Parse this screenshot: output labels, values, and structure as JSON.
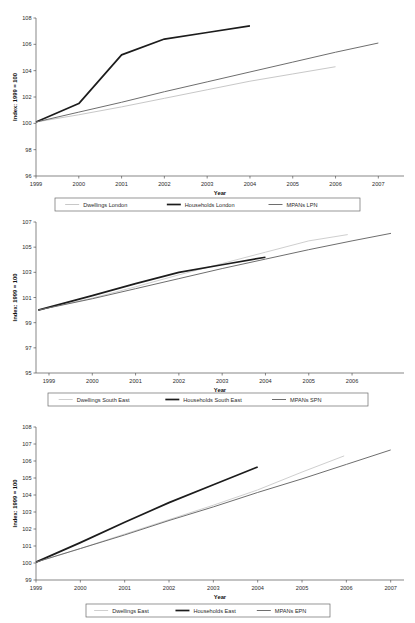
{
  "page": {
    "background": "#ffffff",
    "text_color": "#1a1a1a"
  },
  "chart_data": [
    {
      "id": "london",
      "type": "line",
      "title": "",
      "xlabel": "Year",
      "ylabel": "Index: 1999 = 100",
      "x": [
        1999,
        2000,
        2001,
        2002,
        2003,
        2004,
        2005,
        2006,
        2007
      ],
      "xticks": [
        "1999",
        "2000",
        "2001",
        "2002",
        "2003",
        "2004",
        "2005",
        "2006",
        "2007"
      ],
      "xlim": [
        1999,
        2007.6
      ],
      "ylim": [
        96,
        108
      ],
      "yticks": [
        96,
        98,
        100,
        102,
        104,
        106,
        108
      ],
      "ytick_labels": [
        "96",
        "98",
        "100",
        "102",
        "104",
        "106",
        "108"
      ],
      "grid": false,
      "legend_position": "bottom",
      "series": [
        {
          "name": "Dwellings London",
          "color": "#c8c8c8",
          "width": 1.0,
          "x": [
            1999,
            2000,
            2001,
            2002,
            2003,
            2004,
            2005,
            2006
          ],
          "values": [
            100.1,
            100.65,
            101.25,
            101.9,
            102.55,
            103.2,
            103.75,
            104.3
          ]
        },
        {
          "name": "Households London",
          "color": "#1c1c1c",
          "width": 1.7,
          "x": [
            1999,
            2000,
            2001,
            2002,
            2003,
            2004
          ],
          "values": [
            100.1,
            101.5,
            105.2,
            106.4,
            106.9,
            107.4
          ]
        },
        {
          "name": "MPANs LPN",
          "color": "#6e6e6e",
          "width": 1.0,
          "x": [
            1999,
            2000,
            2001,
            2002,
            2003,
            2004,
            2005,
            2006,
            2007
          ],
          "values": [
            100.1,
            100.85,
            101.6,
            102.4,
            103.15,
            103.9,
            104.65,
            105.4,
            106.1
          ]
        }
      ]
    },
    {
      "id": "south-east",
      "type": "line",
      "title": "",
      "xlabel": "Year",
      "ylabel": "Index: 1999 = 100",
      "x": [
        1999,
        2000,
        2001,
        2002,
        2003,
        2004,
        2005,
        2006
      ],
      "xticks": [
        "1999",
        "2000",
        "2001",
        "2002",
        "2003",
        "2004",
        "2005",
        "2006"
      ],
      "xlim": [
        1998.7,
        2007.2
      ],
      "ylim": [
        95,
        107
      ],
      "yticks": [
        95,
        97,
        99,
        101,
        103,
        105,
        107
      ],
      "ytick_labels": [
        "95",
        "97",
        "99",
        "101",
        "103",
        "105",
        "107"
      ],
      "grid": false,
      "legend_position": "bottom",
      "series": [
        {
          "name": "Dwellings South East",
          "color": "#cfcfcf",
          "width": 1.0,
          "x": [
            1998.75,
            2000,
            2001,
            2002,
            2003,
            2004,
            2005,
            2005.9
          ],
          "values": [
            100.0,
            100.95,
            101.85,
            102.8,
            103.7,
            104.6,
            105.5,
            106.0
          ]
        },
        {
          "name": "Households South East",
          "color": "#1c1c1c",
          "width": 1.7,
          "x": [
            1998.75,
            2000,
            2001,
            2002,
            2003,
            2004
          ],
          "values": [
            100.0,
            101.15,
            102.1,
            103.0,
            103.6,
            104.2
          ]
        },
        {
          "name": "MPANs SPN",
          "color": "#6e6e6e",
          "width": 1.0,
          "x": [
            1998.75,
            2000,
            2001,
            2002,
            2003,
            2004,
            2005,
            2006,
            2006.9
          ],
          "values": [
            100.0,
            100.9,
            101.7,
            102.5,
            103.3,
            104.05,
            104.8,
            105.5,
            106.1
          ]
        }
      ]
    },
    {
      "id": "east",
      "type": "line",
      "title": "",
      "xlabel": "Year",
      "ylabel": "Index: 1999 = 100",
      "x": [
        1999,
        2000,
        2001,
        2002,
        2003,
        2004,
        2005,
        2006,
        2007
      ],
      "xticks": [
        "1999",
        "2000",
        "2001",
        "2002",
        "2003",
        "2004",
        "2005",
        "2006",
        "2007"
      ],
      "xlim": [
        1999,
        2007.3
      ],
      "ylim": [
        99,
        108
      ],
      "yticks": [
        99,
        100,
        101,
        102,
        103,
        104,
        105,
        106,
        107,
        108
      ],
      "ytick_labels": [
        "99",
        "100",
        "101",
        "102",
        "103",
        "104",
        "105",
        "106",
        "107",
        "108"
      ],
      "grid": false,
      "legend_position": "bottom",
      "series": [
        {
          "name": "Dwellings East",
          "color": "#cfcfcf",
          "width": 1.0,
          "x": [
            1999,
            2000,
            2001,
            2002,
            2003,
            2004,
            2005,
            2005.95
          ],
          "values": [
            100.05,
            100.85,
            101.7,
            102.55,
            103.4,
            104.3,
            105.35,
            106.3
          ]
        },
        {
          "name": "Households East",
          "color": "#1c1c1c",
          "width": 1.7,
          "x": [
            1999,
            2000,
            2001,
            2002,
            2003,
            2004
          ],
          "values": [
            100.05,
            101.2,
            102.4,
            103.55,
            104.6,
            105.65
          ]
        },
        {
          "name": "MPANs EPN",
          "color": "#6e6e6e",
          "width": 1.0,
          "x": [
            1999,
            2000,
            2001,
            2002,
            2003,
            2004,
            2005,
            2006,
            2007
          ],
          "values": [
            100.05,
            100.85,
            101.65,
            102.5,
            103.3,
            104.15,
            104.95,
            105.8,
            106.65
          ]
        }
      ]
    }
  ]
}
